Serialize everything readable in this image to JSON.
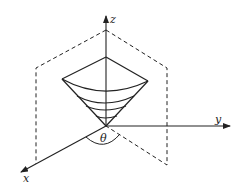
{
  "diagram": {
    "axes": {
      "x_label": "x",
      "y_label": "y",
      "z_label": "z"
    },
    "angle_label": "θ",
    "colors": {
      "line": "#222222",
      "background": "#ffffff"
    }
  }
}
